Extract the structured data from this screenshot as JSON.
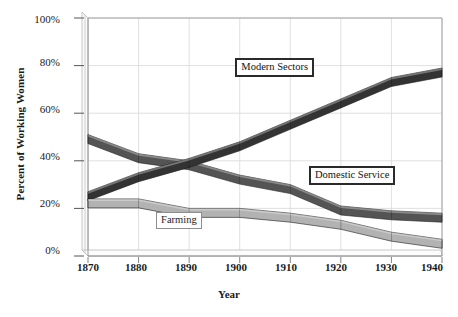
{
  "chart_data": {
    "type": "area",
    "title": "",
    "subtitle": "",
    "xlabel": "Year",
    "ylabel": "Percent of Working Women",
    "categories": [
      1870,
      1880,
      1890,
      1900,
      1910,
      1920,
      1930,
      1940
    ],
    "x_tick_labels": [
      "1870",
      "1880",
      "1890",
      "1900",
      "1910",
      "1920",
      "1930",
      "1940"
    ],
    "y_tick_labels": [
      "0%",
      "20%",
      "40%",
      "60%",
      "80%",
      "100%"
    ],
    "y_tick_values": [
      0,
      20,
      40,
      60,
      80,
      100
    ],
    "xlim": [
      1870,
      1940
    ],
    "ylim": [
      0,
      100
    ],
    "grid": true,
    "legend_position": "inline-annotations",
    "series": [
      {
        "name": "Modern Sectors",
        "color": "#333333",
        "values": [
          27,
          35,
          41,
          48,
          57,
          66,
          75,
          79
        ]
      },
      {
        "name": "Domestic Service",
        "color": "#545454",
        "values": [
          51,
          43,
          40,
          34,
          30,
          21,
          19,
          18
        ]
      },
      {
        "name": "Farming",
        "color": "#b2b2b2",
        "values": [
          24,
          24,
          20,
          20,
          18,
          15,
          10,
          7
        ]
      }
    ],
    "annotations": [
      {
        "text": "Modern Sectors",
        "style": "heavy",
        "x": 1911,
        "y": 80
      },
      {
        "text": "Domestic Service",
        "style": "heavy",
        "x": 1922,
        "y": 34
      },
      {
        "text": "Farming",
        "style": "light",
        "x": 1889,
        "y": 15
      }
    ]
  },
  "axis": {
    "y_title": "Percent of Working Women",
    "x_title": "Year",
    "y_ticks": [
      {
        "label": "100%",
        "value": 100
      },
      {
        "label": "80%",
        "value": 80
      },
      {
        "label": "60%",
        "value": 60
      },
      {
        "label": "40%",
        "value": 40
      },
      {
        "label": "20%",
        "value": 20
      },
      {
        "label": "0%",
        "value": 0
      }
    ],
    "x_ticks": [
      {
        "label": "1870",
        "value": 1870
      },
      {
        "label": "1880",
        "value": 1880
      },
      {
        "label": "1890",
        "value": 1890
      },
      {
        "label": "1900",
        "value": 1900
      },
      {
        "label": "1910",
        "value": 1910
      },
      {
        "label": "1920",
        "value": 1920
      },
      {
        "label": "1930",
        "value": 1930
      },
      {
        "label": "1940",
        "value": 1940
      }
    ]
  },
  "colors": {
    "background": "#ffffff",
    "grid": "#d8d8d8",
    "axis": "#8a8a8a",
    "text": "#1a1a1a",
    "modern_sectors": "#333333",
    "domestic_service": "#545454",
    "farming": "#b2b2b2",
    "ribbon_top_highlight": "#ffffff"
  }
}
